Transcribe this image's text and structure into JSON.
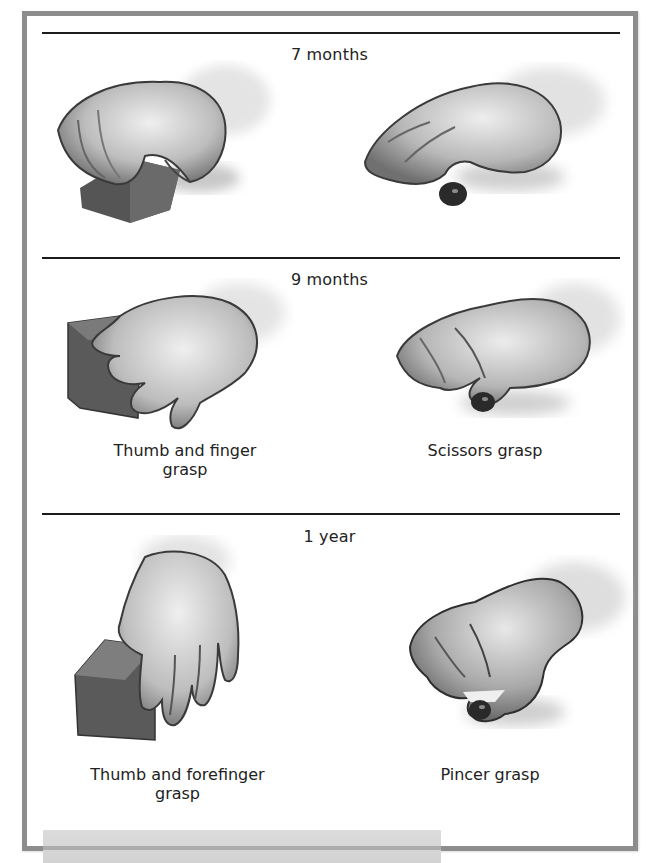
{
  "figure": {
    "colors": {
      "frame_border": "#8d8d8d",
      "rule": "#1c1c1c",
      "skin_light": "#e6e6e6",
      "skin_mid": "#a8a8a8",
      "skin_dark": "#3a3a3a",
      "block": "#5e5e5e",
      "bottom_bar": "#d6d6d6"
    },
    "sections": [
      {
        "age": "7 months",
        "items": [
          {
            "illustration": "hand-grasping-block-palmar",
            "caption": ""
          },
          {
            "illustration": "hand-raking-pellet",
            "caption": ""
          }
        ]
      },
      {
        "age": "9 months",
        "items": [
          {
            "illustration": "hand-grasping-block-thumb-finger",
            "caption_line1": "Thumb and finger",
            "caption_line2": "grasp"
          },
          {
            "illustration": "hand-scissors-grasp-pellet",
            "caption_line1": "Scissors grasp",
            "caption_line2": ""
          }
        ]
      },
      {
        "age": "1 year",
        "items": [
          {
            "illustration": "hand-grasping-block-thumb-forefinger",
            "caption_line1": "Thumb and forefinger",
            "caption_line2": "grasp"
          },
          {
            "illustration": "hand-pincer-grasp-pellet",
            "caption_line1": "Pincer grasp",
            "caption_line2": ""
          }
        ]
      }
    ]
  }
}
